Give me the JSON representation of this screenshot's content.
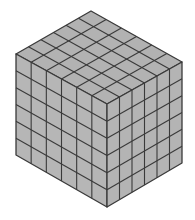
{
  "diagram": {
    "type": "isometric-cube-grid",
    "grid_divisions": 6,
    "colors": {
      "background": "#ffffff",
      "face_fill": "#b5b5b5",
      "top_fill": "#b2b2b2",
      "left_fill": "#b6b6b6",
      "right_fill": "#b4b4b4",
      "line": "#3a3a3a"
    },
    "vertices": {
      "top": [
        91,
        11
      ],
      "left": [
        16,
        54
      ],
      "right": [
        182,
        62
      ],
      "front_top": [
        107,
        104
      ],
      "left_bottom": [
        16,
        155
      ],
      "right_bottom": [
        182,
        163
      ],
      "front_bottom": [
        107,
        207
      ]
    }
  }
}
